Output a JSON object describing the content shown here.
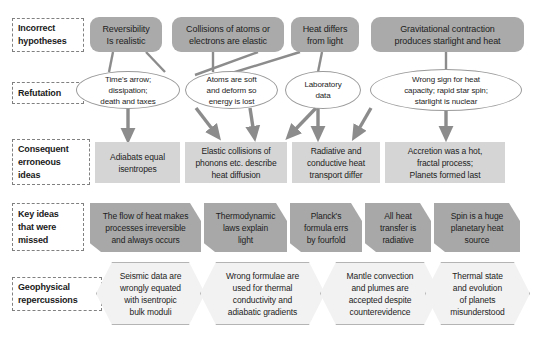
{
  "figure": {
    "type": "flow-diagram",
    "background_color": "#ffffff",
    "palette": {
      "hypothesis_fill": "#aaaaaa",
      "ellipse_stroke": "#9a9a9a",
      "consequent_fill": "#d5d5d5",
      "key_idea_fill": "#a8a8a8",
      "geophysical_fill": "#f2f2f2",
      "connector": "#8c8c8c",
      "label_border": "#808080",
      "text": "#1d1d1d"
    }
  },
  "row_labels": [
    {
      "id": "incorrect-hypotheses",
      "text": "Incorrect\nhypotheses"
    },
    {
      "id": "refutation",
      "text": "Refutation"
    },
    {
      "id": "consequent-erroneous-ideas",
      "text": "Consequent\nerroneous\nideas"
    },
    {
      "id": "key-ideas-that-were-missed",
      "text": "Key ideas\nthat were\nmissed"
    },
    {
      "id": "geophysical-repercussions",
      "text": "Geophysical\nrepercussions"
    }
  ],
  "hypotheses": [
    {
      "id": "reversibility",
      "text": "Reversibility\nIs realistic"
    },
    {
      "id": "collisions",
      "text": "Collisions of atoms or\nelectrons are elastic"
    },
    {
      "id": "heat-differs",
      "text": "Heat differs\nfrom light"
    },
    {
      "id": "gravitational-contraction",
      "text": "Gravitational contraction\nproduces starlight and heat"
    }
  ],
  "refutations": [
    {
      "id": "times-arrow",
      "text": "Time's arrow;\ndissipation;\ndeath and taxes"
    },
    {
      "id": "atoms-soft",
      "text": "Atoms are soft\nand deform so\nenergy is lost"
    },
    {
      "id": "laboratory-data",
      "text": "Laboratory\ndata"
    },
    {
      "id": "wrong-sign",
      "text": "Wrong sign for heat\ncapacity; rapid star spin;\nstarlight is nuclear"
    }
  ],
  "consequent_ideas": [
    {
      "id": "adiabats",
      "text": "Adiabats equal\nisentropes"
    },
    {
      "id": "elastic-collisions",
      "text": "Elastic collisions of\nphonons etc. describe\nheat diffusion"
    },
    {
      "id": "radiative-conductive",
      "text": "Radiative and\nconductive heat\ntransport differ"
    },
    {
      "id": "accretion",
      "text": "Accretion was a hot,\nfractal process;\nPlanets formed last"
    }
  ],
  "key_ideas": [
    {
      "id": "flow-of-heat",
      "text": "The flow of heat makes\nprocesses irreversible\nand always occurs"
    },
    {
      "id": "thermodynamic-laws",
      "text": "Thermodynamic\nlaws explain\nlight"
    },
    {
      "id": "plancks-formula",
      "text": "Planck's\nformula errs\nby fourfold"
    },
    {
      "id": "all-heat-transfer",
      "text": "All heat\ntransfer is\nradiative"
    },
    {
      "id": "spin-heat-source",
      "text": "Spin is a huge\nplanetary heat\nsource"
    }
  ],
  "geophysical_repercussions": [
    {
      "id": "seismic-data",
      "text": "Seismic data are\nwrongly equated\nwith isentropic\nbulk moduli"
    },
    {
      "id": "wrong-formulae",
      "text": "Wrong formulae are\nused for thermal\nconductivity and\nadiabatic gradients"
    },
    {
      "id": "mantle-convection",
      "text": "Mantle convection\nand plumes are\naccepted despite\ncounterevidence"
    },
    {
      "id": "thermal-state",
      "text": "Thermal state\nand evolution\nof planets\nmisunderstood"
    }
  ]
}
